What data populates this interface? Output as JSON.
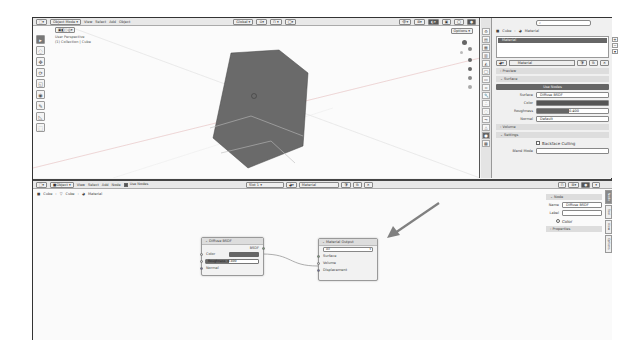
{
  "viewport": {
    "editor_type_icon": "3d-viewport-icon",
    "mode": "Object Mode",
    "menus": [
      "View",
      "Select",
      "Add",
      "Object"
    ],
    "transform_orientation": "Global",
    "options_label": "Options",
    "info_line1": "User Perspective",
    "info_line2": "(1) Collection | Cube",
    "tools": [
      "select-box",
      "cursor",
      "move",
      "rotate",
      "scale",
      "transform",
      "annotate",
      "measure",
      "add-cube"
    ]
  },
  "properties": {
    "search_placeholder": "",
    "breadcrumb": [
      "Cube",
      "Material"
    ],
    "material_slot": "Material",
    "material_name": "Material",
    "sections": {
      "preview": "Preview",
      "surface": "Surface",
      "volume": "Volume",
      "settings": "Settings"
    },
    "use_nodes_label": "Use Nodes",
    "surface_label": "Surface",
    "surface_value": "Diffuse BSDF",
    "color_label": "Color",
    "roughness_label": "Roughness",
    "roughness_value": "0.400",
    "normal_label": "Normal",
    "normal_value": "Default",
    "backface_culling_label": "Backface Culling",
    "blend_mode_label": "Blend Mode"
  },
  "node_editor": {
    "editor_type_icon": "node-editor-icon",
    "object_dropdown": "Object",
    "menus": [
      "View",
      "Select",
      "Add",
      "Node"
    ],
    "use_nodes_label": "Use Nodes",
    "slot": "Slot 1",
    "material": "Material",
    "breadcrumb": [
      "Cube",
      "Cube",
      "Material"
    ],
    "nodes": {
      "diffuse": {
        "title": "Diffuse BSDF",
        "output": "BSDF",
        "color_label": "Color",
        "roughness_label": "Roughness",
        "roughness_value": "0.400",
        "normal_label": "Normal"
      },
      "output": {
        "title": "Material Output",
        "target": "All",
        "surface": "Surface",
        "volume": "Volume",
        "displacement": "Displacement"
      }
    },
    "sidebar": {
      "node_panel": "Node",
      "name_label": "Name",
      "name_value": "Diffuse BSDF",
      "label_label": "Label",
      "label_value": "",
      "color_label": "Color",
      "properties_panel": "Properties",
      "tabs": [
        "Node",
        "Tool",
        "View",
        "Options"
      ]
    }
  },
  "colors": {
    "cube": "#6a6a6a",
    "accent_dark": "#666666",
    "arrow": "#808080"
  }
}
